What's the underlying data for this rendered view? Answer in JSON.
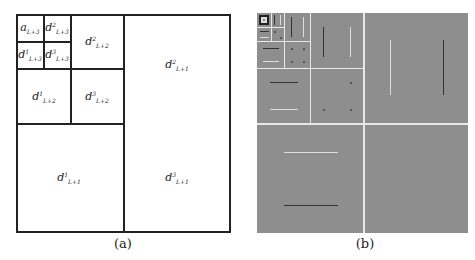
{
  "diagram_a": {
    "caption": "(a)",
    "cells": [
      {
        "base": "a",
        "sup": "",
        "sub": "L+3"
      },
      {
        "base": "d",
        "sup": "2",
        "sub": "L+3"
      },
      {
        "base": "d",
        "sup": "1",
        "sub": "L+3"
      },
      {
        "base": "d",
        "sup": "3",
        "sub": "L+3"
      },
      {
        "base": "d",
        "sup": "2",
        "sub": "L+2"
      },
      {
        "base": "d",
        "sup": "1",
        "sub": "L+2"
      },
      {
        "base": "d",
        "sup": "3",
        "sub": "L+2"
      },
      {
        "base": "d",
        "sup": "2",
        "sub": "L+1"
      },
      {
        "base": "d",
        "sup": "1",
        "sub": "L+1"
      },
      {
        "base": "d",
        "sup": "3",
        "sub": "L+1"
      }
    ]
  },
  "diagram_b": {
    "caption": "(b)",
    "background": "#8e8e8e",
    "divider_color": "#e8e8e8"
  }
}
